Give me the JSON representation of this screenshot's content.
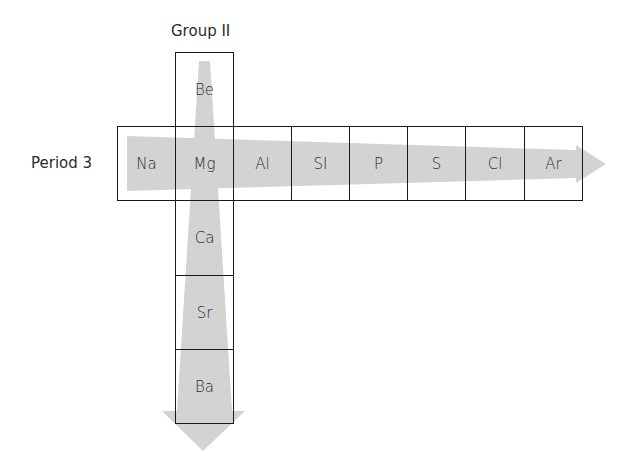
{
  "labels": {
    "group": "Group II",
    "period": "Period 3"
  },
  "period_row": [
    "Na",
    "Mg",
    "Al",
    "SI",
    "P",
    "S",
    "Cl",
    "Ar"
  ],
  "group_column": {
    "above": [
      "Be"
    ],
    "below": [
      "Ca",
      "Sr",
      "Ba"
    ]
  },
  "colors": {
    "arrow_fill": "#d3d3d3",
    "border": "#1a1a1a",
    "text": "#2b2b2b"
  }
}
